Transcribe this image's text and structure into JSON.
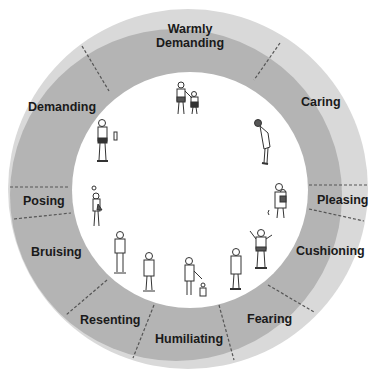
{
  "diagram": {
    "colors": {
      "outer_band": "#d9d9d9",
      "inner_band": "#b4b4b4",
      "center": "#ffffff",
      "divider": "#555555",
      "text": "#1a1a1a"
    },
    "segments": [
      {
        "id": "warmly-demanding",
        "line1": "Warmly",
        "line2": "Demanding"
      },
      {
        "id": "caring",
        "label": "Caring"
      },
      {
        "id": "pleasing",
        "label": "Pleasing"
      },
      {
        "id": "cushioning",
        "label": "Cushioning"
      },
      {
        "id": "fearing",
        "label": "Fearing"
      },
      {
        "id": "humiliating",
        "label": "Humiliating"
      },
      {
        "id": "resenting",
        "label": "Resenting"
      },
      {
        "id": "bruising",
        "label": "Bruising"
      },
      {
        "id": "posing",
        "label": "Posing"
      },
      {
        "id": "demanding",
        "label": "Demanding"
      }
    ],
    "figures": [
      "adult-and-child-standing-together",
      "woman-bending-forward",
      "adult-holding-child",
      "child-with-raised-arms",
      "child-standing-hands-together",
      "adult-with-small-child",
      "girl-standing",
      "boy-arms-crossed",
      "figure-posing-with-child",
      "man-standing-with-bottle"
    ]
  }
}
